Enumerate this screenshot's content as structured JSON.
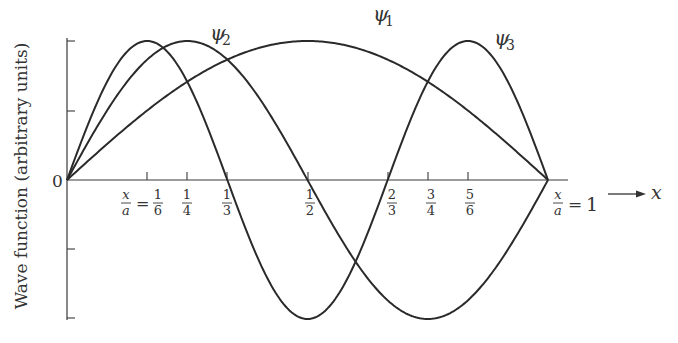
{
  "chart_data": {
    "type": "line",
    "title": "",
    "xlabel": "x",
    "ylabel": "Wave function (arbitrary units)",
    "origin_label": "0",
    "xlim": [
      0,
      1
    ],
    "ylim": [
      -1,
      1
    ],
    "x_variable": "x/a",
    "grid": false,
    "legend": "inline curve labels",
    "x_ticks": [
      {
        "value": 0.1667,
        "num": "1",
        "den": "6",
        "prefix": "x/a ="
      },
      {
        "value": 0.25,
        "num": "1",
        "den": "4"
      },
      {
        "value": 0.3333,
        "num": "1",
        "den": "3"
      },
      {
        "value": 0.5,
        "num": "1",
        "den": "2"
      },
      {
        "value": 0.6667,
        "num": "2",
        "den": "3"
      },
      {
        "value": 0.75,
        "num": "3",
        "den": "4"
      },
      {
        "value": 0.8333,
        "num": "5",
        "den": "6"
      },
      {
        "value": 1.0,
        "label": "x/a = 1"
      }
    ],
    "y_ticks": [
      -1,
      -0.5,
      0,
      0.5,
      1
    ],
    "series": [
      {
        "name": "ψ1",
        "sym": "ψ",
        "sub": "1",
        "function": "sin(πx/a)",
        "n": 1,
        "x": [
          0,
          0.1667,
          0.25,
          0.3333,
          0.5,
          0.6667,
          0.75,
          0.8333,
          1
        ],
        "values": [
          0,
          0.5,
          0.707,
          0.866,
          1,
          0.866,
          0.707,
          0.5,
          0
        ]
      },
      {
        "name": "ψ2",
        "sym": "ψ",
        "sub": "2",
        "function": "sin(2πx/a)",
        "n": 2,
        "x": [
          0,
          0.1667,
          0.25,
          0.3333,
          0.5,
          0.6667,
          0.75,
          0.8333,
          1
        ],
        "values": [
          0,
          0.866,
          1,
          0.866,
          0,
          -0.866,
          -1,
          -0.866,
          0
        ]
      },
      {
        "name": "ψ3",
        "sym": "ψ",
        "sub": "3",
        "function": "sin(3πx/a)",
        "n": 3,
        "x": [
          0,
          0.1667,
          0.25,
          0.3333,
          0.5,
          0.6667,
          0.75,
          0.8333,
          1
        ],
        "values": [
          0,
          1,
          0.707,
          0,
          -1,
          0,
          0.707,
          1,
          0
        ]
      }
    ],
    "arrow_label": "x"
  },
  "labels": {
    "y_axis": "Wave function (arbitrary units)",
    "origin": "0",
    "x_var_num": "x",
    "x_var_den": "a",
    "equals": "=",
    "one": "1",
    "x_arrow": "x",
    "psi": "ψ",
    "psi1_sub": "1",
    "psi2_sub": "2",
    "psi3_sub": "3",
    "t16_num": "1",
    "t16_den": "6",
    "t14_num": "1",
    "t14_den": "4",
    "t13_num": "1",
    "t13_den": "3",
    "t12_num": "1",
    "t12_den": "2",
    "t23_num": "2",
    "t23_den": "3",
    "t34_num": "3",
    "t34_den": "4",
    "t56_num": "5",
    "t56_den": "6"
  }
}
